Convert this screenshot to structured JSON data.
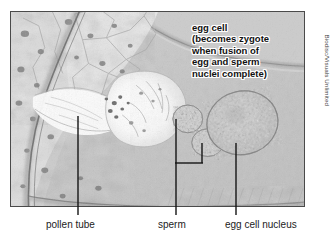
{
  "figure": {
    "callout": {
      "text": "egg cell\n(becomes zygote\nwhen fusion of\negg and sperm\nnuclei complete)",
      "lines": [
        "egg cell",
        "(becomes zygote",
        "when fusion of",
        "egg and sperm",
        "nuclei complete)"
      ]
    },
    "labels": {
      "pollen_tube": "pollen tube",
      "sperm": "sperm",
      "egg_cell_nucleus": "egg cell nucleus"
    },
    "credit": "Biodisc/Visuals Unlimited",
    "colors": {
      "background": "#ffffff",
      "frame_border": "#4a4a4a",
      "leader_line": "#151515",
      "label_text": "#1c1c1c",
      "callout_text": "#111111",
      "callout_halo": "#ffffff",
      "credit_text": "#3d3d3d",
      "tissue_mid": "#c2c2c2",
      "tissue_light": "#e8e8e8",
      "tissue_dark": "#8a8a8a",
      "lumen_white": "#fbfbfb"
    },
    "image_type": "light micrograph"
  }
}
